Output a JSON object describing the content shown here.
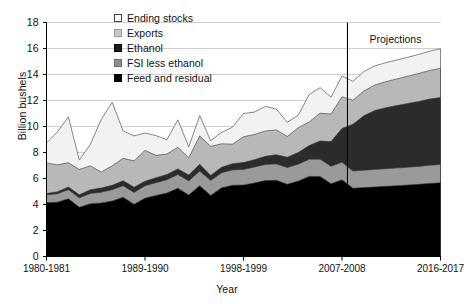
{
  "chart_data": {
    "type": "area",
    "stacked": true,
    "title": "",
    "subtitle": "",
    "xlabel": "Year",
    "ylabel": "Billion bushels",
    "ylim": [
      0,
      18
    ],
    "ytick_step": 2,
    "yticks": [
      "0",
      "2",
      "4",
      "6",
      "8",
      "10",
      "12",
      "14",
      "16",
      "18"
    ],
    "xticks": [
      "1980-1981",
      "1989-1990",
      "1998-1999",
      "2007-2008",
      "2016-2017"
    ],
    "xtick_indices": [
      0,
      9,
      18,
      27,
      36
    ],
    "grid": true,
    "grid_axis": "y",
    "legend_position": "top-center",
    "annotations": [
      {
        "name": "projection-divider",
        "label": "Projections",
        "x_index": 27.5,
        "type": "vline-with-text"
      }
    ],
    "x": [
      "1980-1981",
      "1981-1982",
      "1982-1983",
      "1983-1984",
      "1984-1985",
      "1985-1986",
      "1986-1987",
      "1987-1988",
      "1988-1989",
      "1989-1990",
      "1990-1991",
      "1991-1992",
      "1992-1993",
      "1993-1994",
      "1994-1995",
      "1995-1996",
      "1996-1997",
      "1997-1998",
      "1998-1999",
      "1999-2000",
      "2000-2001",
      "2001-2002",
      "2002-2003",
      "2003-2004",
      "2004-2005",
      "2005-2006",
      "2006-2007",
      "2007-2008",
      "2008-2009",
      "2009-2010",
      "2010-2011",
      "2011-2012",
      "2012-2013",
      "2013-2014",
      "2014-2015",
      "2015-2016",
      "2016-2017"
    ],
    "series": [
      {
        "name": "Feed and residual",
        "color": "#000000",
        "order": 1,
        "values": [
          4.14,
          4.18,
          4.44,
          3.79,
          4.06,
          4.12,
          4.27,
          4.55,
          4.01,
          4.49,
          4.7,
          4.88,
          5.25,
          4.73,
          5.45,
          4.7,
          5.28,
          5.48,
          5.5,
          5.66,
          5.84,
          5.86,
          5.56,
          5.8,
          6.16,
          6.16,
          5.6,
          5.9,
          5.25,
          5.3,
          5.35,
          5.4,
          5.45,
          5.5,
          5.55,
          5.62,
          5.68
        ]
      },
      {
        "name": "FSI less ethanol",
        "color": "#9a9a9a",
        "order": 2,
        "values": [
          0.6,
          0.65,
          0.7,
          0.72,
          0.78,
          0.82,
          0.86,
          0.9,
          0.92,
          0.95,
          0.98,
          1.02,
          1.06,
          1.08,
          1.12,
          1.14,
          1.16,
          1.18,
          1.2,
          1.22,
          1.24,
          1.26,
          1.28,
          1.3,
          1.32,
          1.33,
          1.34,
          1.35,
          1.32,
          1.33,
          1.34,
          1.35,
          1.36,
          1.37,
          1.38,
          1.39,
          1.4
        ]
      },
      {
        "name": "Ethanol",
        "color": "#2b2b2b",
        "order": 3,
        "values": [
          0.1,
          0.15,
          0.2,
          0.24,
          0.3,
          0.32,
          0.35,
          0.38,
          0.4,
          0.35,
          0.38,
          0.4,
          0.43,
          0.46,
          0.53,
          0.4,
          0.43,
          0.48,
          0.53,
          0.57,
          0.63,
          0.71,
          0.8,
          0.9,
          1.05,
          1.4,
          1.9,
          2.6,
          3.6,
          4.2,
          4.55,
          4.7,
          4.8,
          4.9,
          5.0,
          5.1,
          5.15
        ]
      },
      {
        "name": "Exports",
        "color": "#b8b8b8",
        "order": 4,
        "values": [
          2.36,
          2.07,
          1.87,
          1.95,
          1.83,
          1.24,
          1.5,
          1.72,
          2.02,
          2.37,
          1.72,
          1.58,
          1.66,
          1.32,
          2.18,
          2.23,
          1.8,
          1.5,
          1.98,
          1.94,
          1.94,
          1.91,
          1.59,
          1.9,
          1.82,
          2.13,
          2.12,
          2.44,
          1.85,
          1.9,
          1.95,
          2.0,
          2.05,
          2.1,
          2.15,
          2.2,
          2.25
        ]
      },
      {
        "name": "Ending stocks",
        "color": "#f2f2f2",
        "order": 5,
        "values": [
          1.54,
          2.54,
          3.53,
          0.71,
          1.65,
          4.04,
          4.88,
          2.11,
          1.93,
          1.34,
          1.52,
          1.1,
          2.11,
          0.85,
          1.56,
          0.43,
          0.88,
          1.31,
          1.79,
          1.72,
          1.9,
          1.6,
          1.09,
          0.96,
          2.11,
          1.97,
          1.3,
          1.6,
          1.45,
          1.5,
          1.47,
          1.46,
          1.45,
          1.45,
          1.46,
          1.48,
          1.5
        ]
      }
    ]
  },
  "legend": {
    "items": [
      {
        "label": "Ending stocks",
        "color": "#ffffff",
        "border": "#444444"
      },
      {
        "label": "Exports",
        "color": "#c9c9c9",
        "border": "#9a9a9a"
      },
      {
        "label": "Ethanol",
        "color": "#1a1a1a",
        "border": "#000000"
      },
      {
        "label": "FSI less ethanol",
        "color": "#8f8f8f",
        "border": "#6d6d6d"
      },
      {
        "label": "Feed and residual",
        "color": "#000000",
        "border": "#000000"
      }
    ]
  },
  "axes": {
    "y_title": "Billion bushels",
    "x_title": "Year"
  },
  "projection": {
    "label": "Projections"
  }
}
